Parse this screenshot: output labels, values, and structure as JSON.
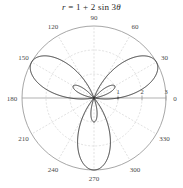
{
  "figure": {
    "width": 183,
    "height": 188,
    "background_color": "#ffffff"
  },
  "title": {
    "text": "r = 1 + 2 sin 3θ",
    "parts": {
      "r": "r",
      "equals": " = 1 + 2 sin 3",
      "theta": "θ"
    }
  },
  "chart_data": {
    "type": "line",
    "plot_style": "polar",
    "title": "r = 1 + 2 sin 3θ",
    "equation": "r = 1 + 2 sin 3θ",
    "xlabel": "",
    "ylabel": "",
    "grid": true,
    "legend": null,
    "angle_unit": "degrees",
    "angular_tick_labels": [
      "0",
      "30",
      "60",
      "90",
      "120",
      "150",
      "180",
      "210",
      "240",
      "270",
      "300",
      "330"
    ],
    "angular_tick_values": [
      0,
      30,
      60,
      90,
      120,
      150,
      180,
      210,
      240,
      270,
      300,
      330
    ],
    "radial_tick_labels": [
      "1",
      "2",
      "3"
    ],
    "radial_tick_values": [
      1,
      2,
      3
    ],
    "rlim": [
      0,
      3
    ],
    "series": [
      {
        "name": "r = 1 + 2 sin 3θ",
        "color": "#333333",
        "line_width": 1.0,
        "formula": "r = 1 + 2*sin(3*theta)",
        "r_max": 3,
        "r_min": -1,
        "major_petal_directions_deg": [
          30,
          150,
          270
        ],
        "minor_petal_directions_deg": [
          90,
          210,
          330
        ],
        "major_petal_peak_r": 3,
        "minor_petal_peak_r": 1
      }
    ]
  },
  "colors": {
    "curve": "#333333",
    "outer_circle": "#8d8d8d",
    "grid_circle": "#c9c9c9",
    "grid_spoke": "#c9c9c9",
    "axis_line": "#8d8d8d",
    "tick_text": "#4a4a4a",
    "title_text": "#2a2a2a"
  },
  "geometry": {
    "center_x": 94,
    "center_y": 98,
    "outer_radius": 72,
    "radial_circle_radii": [
      24,
      48,
      72
    ]
  }
}
